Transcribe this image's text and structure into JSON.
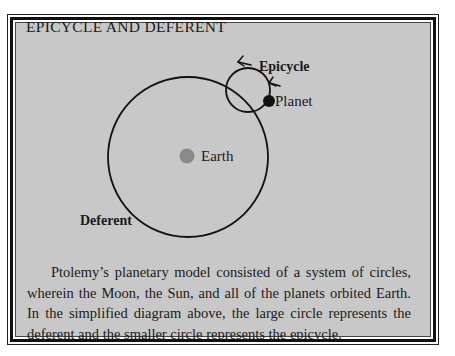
{
  "title": "EPICYCLE AND DEFERENT",
  "labels": {
    "epicycle": "Epicycle",
    "planet": "Planet",
    "earth": "Earth",
    "deferent": "Deferent"
  },
  "caption": "Ptolemy’s planetary model consisted of a system of circles, wherein the Moon, the Sun, and all of the planets orbited Earth. In the simplified diagram above, the large circle represents the deferent and the smaller circle represents the epicycle.",
  "colors": {
    "panel_background": "#c8c8c8",
    "earth_dot": "#8a8a8a",
    "planet_dot": "#111111",
    "line": "#111111"
  }
}
